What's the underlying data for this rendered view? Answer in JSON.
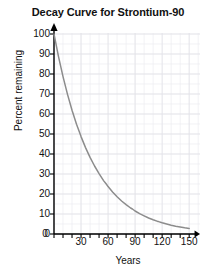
{
  "chart_data": {
    "type": "line",
    "title": "Decay Curve for Strontium-90",
    "xlabel": "Years",
    "ylabel": "Percent remaining",
    "xlim": [
      0,
      150
    ],
    "ylim": [
      0,
      100
    ],
    "grid": true,
    "legend": "none",
    "x_ticks": [
      0,
      30,
      60,
      90,
      120,
      150
    ],
    "x_tick_labels": [
      "0",
      "30",
      "60",
      "90",
      "120",
      "150"
    ],
    "x_minor_tick_step": 10,
    "y_ticks": [
      0,
      10,
      20,
      30,
      40,
      50,
      60,
      70,
      80,
      90,
      100
    ],
    "y_tick_labels": [
      "0",
      "10",
      "20",
      "30",
      "40",
      "50",
      "60",
      "70",
      "80",
      "90",
      "100"
    ],
    "half_life_years": 29,
    "curve_color": "#8c8c8c",
    "grid_color": "#ececf0",
    "axis_color": "#000000",
    "series": [
      {
        "name": "Strontium-90 remaining",
        "x": [
          0,
          5,
          10,
          15,
          20,
          25,
          29,
          30,
          35,
          40,
          45,
          50,
          55,
          58,
          60,
          65,
          70,
          75,
          80,
          85,
          87,
          90,
          95,
          100,
          105,
          110,
          115,
          116,
          120,
          125,
          130,
          135,
          140,
          145,
          150
        ],
        "values": [
          100.0,
          88.7,
          78.7,
          69.8,
          61.9,
          54.9,
          50.0,
          48.7,
          43.2,
          38.3,
          34.0,
          30.2,
          26.7,
          25.0,
          23.7,
          21.0,
          18.6,
          16.5,
          14.7,
          13.0,
          12.5,
          11.5,
          10.2,
          9.1,
          8.0,
          7.1,
          6.3,
          6.2,
          5.6,
          5.0,
          4.4,
          3.9,
          3.5,
          3.1,
          2.8
        ]
      }
    ]
  },
  "figure": {
    "width": 216,
    "height": 277,
    "background": "#ffffff"
  }
}
